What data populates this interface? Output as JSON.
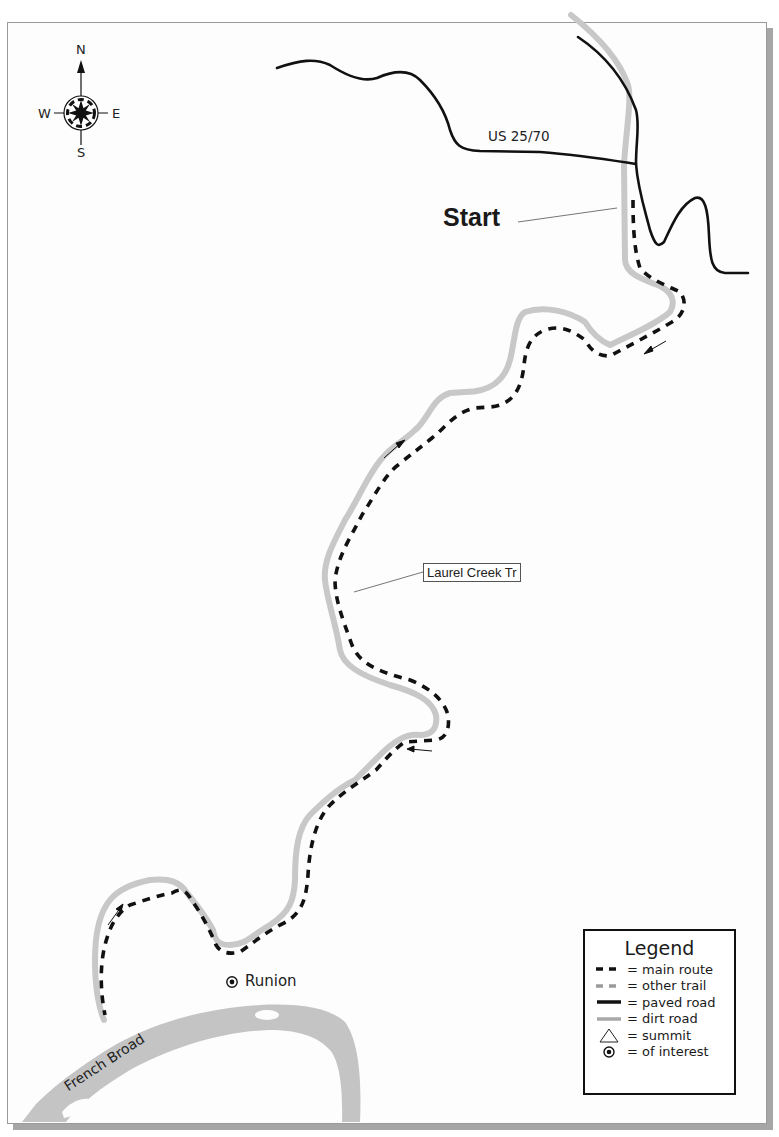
{
  "compass": {
    "north": "N",
    "south": "S",
    "east": "E",
    "west": "W"
  },
  "labels": {
    "start": "Start",
    "road": "US 25/70",
    "trail": "Laurel Creek Tr",
    "poi": "Runion",
    "river": "French Broad"
  },
  "legend": {
    "title": "Legend",
    "items": [
      {
        "symbol": "main-route",
        "label": "= main route"
      },
      {
        "symbol": "other-trail",
        "label": "= other trail"
      },
      {
        "symbol": "paved-road",
        "label": "= paved road"
      },
      {
        "symbol": "dirt-road",
        "label": "= dirt road"
      },
      {
        "symbol": "summit",
        "label": "= summit"
      },
      {
        "symbol": "of-interest",
        "label": "= of interest"
      }
    ]
  },
  "colors": {
    "paved_road": "#111111",
    "dirt_road": "#c8c8c8",
    "main_route": "#111111",
    "other_trail": "#9a9a9a",
    "river": "#c4c4c4",
    "frame": "#9a9a9a",
    "frame_shadow": "#a6a6a6"
  }
}
